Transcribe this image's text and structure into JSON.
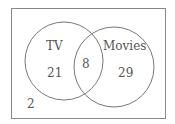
{
  "diagram": {
    "type": "venn",
    "sets": [
      {
        "label": "TV",
        "only": "21"
      },
      {
        "label": "Movies",
        "only": "29"
      }
    ],
    "intersection": "8",
    "outside": "2",
    "colors": {
      "stroke": "#777777",
      "text": "#555555"
    }
  }
}
